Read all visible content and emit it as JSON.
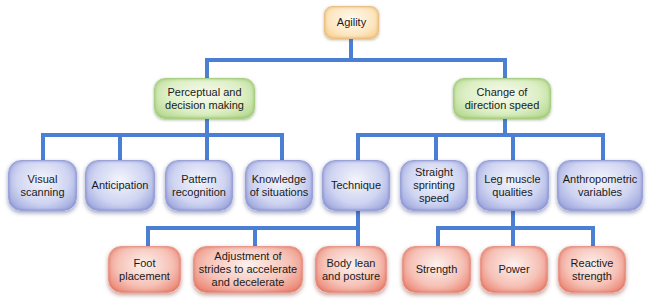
{
  "diagram": {
    "title": "Agility",
    "colors": {
      "connector": "#4a7fd4",
      "root": "#fde6c0",
      "level1": "#dcefc4",
      "level2": "#cfd4f1",
      "level3": "#f6c1b6"
    },
    "root": {
      "label": "Agility"
    },
    "level1": [
      {
        "label": "Perceptual and\ndecision making"
      },
      {
        "label": "Change of\ndirection speed"
      }
    ],
    "level2": [
      {
        "label": "Visual\nscanning",
        "parent": "Perceptual and decision making"
      },
      {
        "label": "Anticipation",
        "parent": "Perceptual and decision making"
      },
      {
        "label": "Pattern\nrecognition",
        "parent": "Perceptual and decision making"
      },
      {
        "label": "Knowledge\nof situations",
        "parent": "Perceptual and decision making"
      },
      {
        "label": "Technique",
        "parent": "Change of direction speed"
      },
      {
        "label": "Straight\nsprinting\nspeed",
        "parent": "Change of direction speed"
      },
      {
        "label": "Leg muscle\nqualities",
        "parent": "Change of direction speed"
      },
      {
        "label": "Anthropometric\nvariables",
        "parent": "Change of direction speed"
      }
    ],
    "level3": [
      {
        "label": "Foot\nplacement",
        "parent": "Technique"
      },
      {
        "label": "Adjustment of\nstrides to accelerate\nand decelerate",
        "parent": "Technique"
      },
      {
        "label": "Body lean\nand posture",
        "parent": "Technique"
      },
      {
        "label": "Strength",
        "parent": "Leg muscle qualities"
      },
      {
        "label": "Power",
        "parent": "Leg muscle qualities"
      },
      {
        "label": "Reactive\nstrength",
        "parent": "Leg muscle qualities"
      }
    ]
  }
}
